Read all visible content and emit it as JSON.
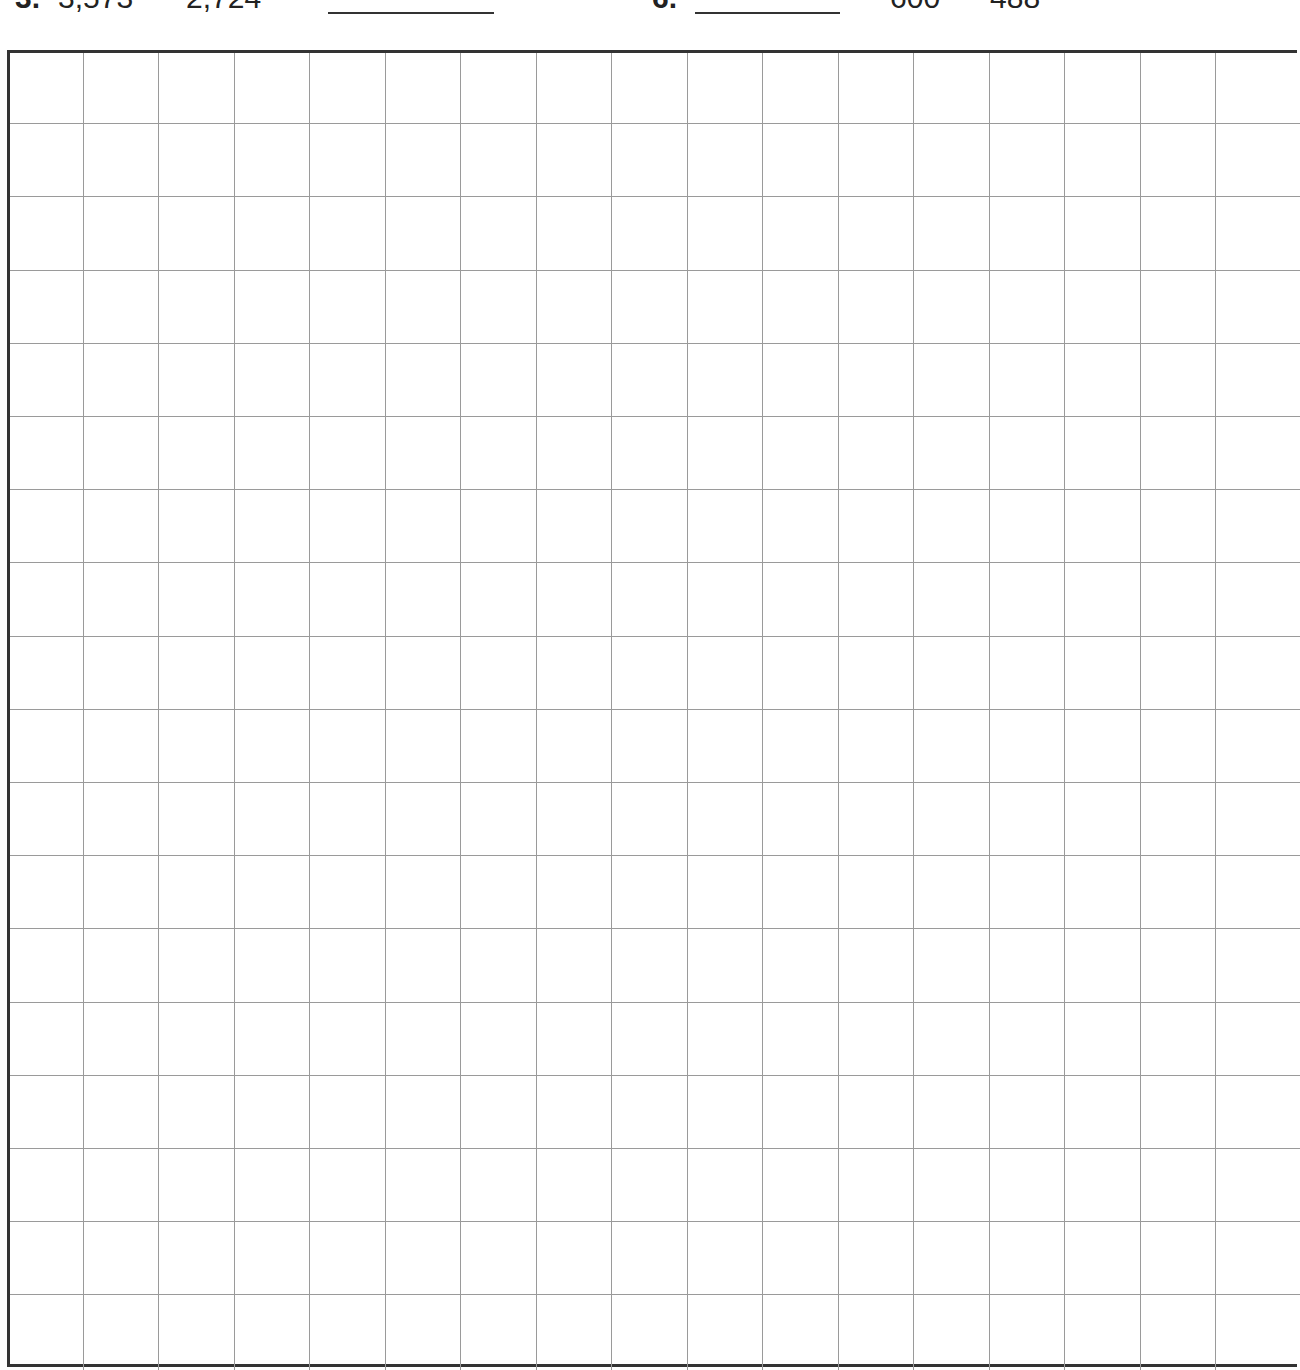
{
  "worksheet": {
    "problems": [
      {
        "number": "3.",
        "operand_1": "3,573",
        "operand_2": "2,724",
        "answer": ""
      },
      {
        "number": "6.",
        "answer": "",
        "operand_1": "600",
        "operand_2": "488"
      }
    ],
    "grid": {
      "columns": 17,
      "rows": 18,
      "cell_width_px": 75.5,
      "cell_height_px": 73.2,
      "line_color": "#9a9a9a",
      "border_color": "#333333"
    }
  }
}
